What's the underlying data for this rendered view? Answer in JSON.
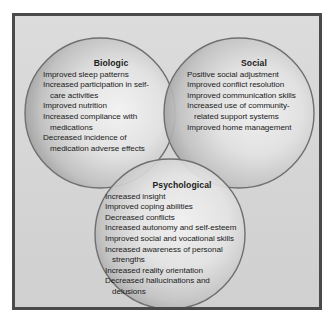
{
  "figure": {
    "frame_border_color": "#4a4a4a",
    "background_color": "#d7d7d7",
    "circle_fill_light": "#eaeaea",
    "circle_fill_dark": "#8d8d8d",
    "circle_stroke_color": "#6f6f6f",
    "text_color": "#1b1b1b"
  },
  "circles": [
    {
      "id": "biologic",
      "heading": "Biologic",
      "cx": 85,
      "cy": 97,
      "r": 75,
      "items": [
        {
          "text": "Improved sleep patterns",
          "indent": false
        },
        {
          "text": "Increased participation in self-",
          "indent": false
        },
        {
          "text": "care activities",
          "indent": true
        },
        {
          "text": "Improved nutrition",
          "indent": false
        },
        {
          "text": "Increased compliance with",
          "indent": false
        },
        {
          "text": "medications",
          "indent": true
        },
        {
          "text": "Decreased incidence of",
          "indent": false
        },
        {
          "text": "medication adverse effects",
          "indent": true
        }
      ]
    },
    {
      "id": "social",
      "heading": "Social",
      "cx": 224,
      "cy": 97,
      "r": 75,
      "items": [
        {
          "text": "Positive social adjustment",
          "indent": false
        },
        {
          "text": "Improved conflict resolution",
          "indent": false
        },
        {
          "text": "Improved communication skills",
          "indent": false
        },
        {
          "text": "Increased use of community-",
          "indent": false
        },
        {
          "text": "related support systems",
          "indent": true
        },
        {
          "text": "Improved home management",
          "indent": false
        }
      ]
    },
    {
      "id": "psychological",
      "heading": "Psychological",
      "cx": 155,
      "cy": 218,
      "r": 75,
      "items": [
        {
          "text": "Increased insight",
          "indent": false
        },
        {
          "text": "Improved coping abilities",
          "indent": false
        },
        {
          "text": "Decreased conflicts",
          "indent": false
        },
        {
          "text": "Increased autonomy and self-esteem",
          "indent": false
        },
        {
          "text": "Improved social and vocational skills",
          "indent": false
        },
        {
          "text": "Increased awareness of personal",
          "indent": false
        },
        {
          "text": "strengths",
          "indent": true
        },
        {
          "text": "Increased reality orientation",
          "indent": false
        },
        {
          "text": "Decreased hallucinations and",
          "indent": false
        },
        {
          "text": "delusions",
          "indent": true
        }
      ]
    }
  ]
}
